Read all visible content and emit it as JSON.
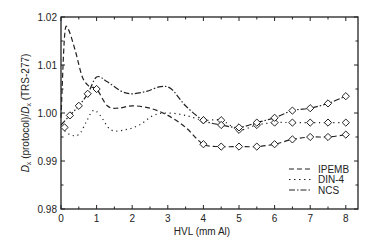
{
  "chart_data": {
    "type": "line",
    "title": "",
    "xlabel": "HVL (mm Al)",
    "ylabel": "D_x (protocol)/D_x (TRS-277)",
    "ylabel_parts": {
      "d": "D",
      "sub": "x",
      "mid": " (protocol)/",
      "d2": "D",
      "sub2": "x",
      "end": " (TRS-277)"
    },
    "xlim": [
      0,
      8.3
    ],
    "ylim": [
      0.98,
      1.02
    ],
    "xticks": [
      0,
      1,
      2,
      3,
      4,
      5,
      6,
      7,
      8
    ],
    "yticks": [
      0.98,
      0.99,
      1.0,
      1.01,
      1.02
    ],
    "ytick_labels": [
      "0.98",
      "0.99",
      "1.00",
      "1.01",
      "1.02"
    ],
    "grid": false,
    "legend_position": "lower right",
    "series": [
      {
        "name": "IPEMB",
        "style": "dashed",
        "x": [
          0.0,
          0.1,
          0.2,
          0.4,
          0.6,
          0.8,
          1.0,
          1.3,
          1.6,
          2.0,
          2.5,
          3.0,
          3.5,
          4.0,
          4.5,
          5.0,
          5.5,
          6.0,
          6.5,
          7.0,
          7.5,
          8.0
        ],
        "values": [
          0.999,
          1.016,
          1.0175,
          1.013,
          1.0075,
          1.0055,
          1.005,
          1.0015,
          1.001,
          1.0015,
          1.001,
          0.9995,
          0.997,
          0.9935,
          0.993,
          0.993,
          0.993,
          0.9935,
          0.9945,
          0.995,
          0.995,
          0.9955
        ],
        "markers_x": [
          4.0,
          4.5,
          5.0,
          5.5,
          6.0,
          6.5,
          7.0,
          7.5,
          8.0
        ],
        "markers_y": [
          0.9935,
          0.993,
          0.993,
          0.993,
          0.9935,
          0.9945,
          0.995,
          0.995,
          0.9955
        ]
      },
      {
        "name": "DIN-4",
        "style": "dotted",
        "x": [
          0.0,
          0.25,
          0.5,
          0.7,
          0.9,
          1.1,
          1.4,
          1.8,
          2.2,
          2.6,
          3.0,
          3.5,
          4.0,
          4.5,
          5.0,
          5.5,
          6.0,
          6.5,
          7.0,
          7.5,
          8.0
        ],
        "values": [
          0.997,
          0.9955,
          0.9955,
          0.998,
          1.0005,
          0.9995,
          0.9965,
          0.9965,
          0.9975,
          0.9995,
          1.0,
          0.9995,
          0.9985,
          0.9985,
          0.9965,
          0.9975,
          0.998,
          0.998,
          0.998,
          0.998,
          0.998
        ],
        "markers_x": [
          4.0,
          4.5,
          5.0,
          5.5,
          6.0,
          6.5,
          7.0,
          7.5,
          8.0
        ],
        "markers_y": [
          0.9985,
          0.9985,
          0.9965,
          0.9975,
          0.998,
          0.998,
          0.998,
          0.998,
          0.998
        ]
      },
      {
        "name": "NCS",
        "style": "dashdot",
        "x": [
          0.0,
          0.25,
          0.5,
          0.75,
          1.0,
          1.3,
          1.7,
          2.0,
          2.4,
          2.8,
          3.1,
          3.5,
          4.0,
          4.5,
          5.0,
          5.5,
          6.0,
          6.5,
          7.0,
          7.5,
          8.0
        ],
        "values": [
          0.9975,
          0.9995,
          1.0015,
          1.004,
          1.0075,
          1.0065,
          1.0045,
          1.004,
          1.0045,
          1.0055,
          1.005,
          1.0015,
          0.9985,
          0.9975,
          0.997,
          0.998,
          0.999,
          1.0005,
          1.001,
          1.002,
          1.0035
        ],
        "markers_x": [
          0.1,
          0.25,
          0.5,
          0.75,
          1.0,
          4.0,
          4.5,
          5.0,
          5.5,
          6.0,
          6.5,
          7.0,
          7.5,
          8.0
        ],
        "markers_y": [
          0.997,
          0.9995,
          1.0015,
          1.004,
          1.005,
          0.9985,
          0.9975,
          0.997,
          0.998,
          0.999,
          1.0005,
          1.001,
          1.002,
          1.0035
        ]
      }
    ]
  },
  "legend": {
    "items": [
      {
        "label": "IPEMB",
        "dash": "5,3"
      },
      {
        "label": "DIN-4",
        "dash": "1.5,3.5"
      },
      {
        "label": "NCS",
        "dash": "6,2,1.5,2"
      }
    ]
  }
}
